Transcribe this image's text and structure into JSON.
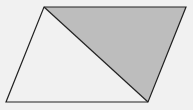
{
  "diagram": {
    "type": "parallelogram-with-diagonal",
    "background": "#f1f1f1",
    "stroke": "#222222",
    "shade_fill": "#bdbdbd",
    "vertices": {
      "top_left": [
        44,
        7
      ],
      "top_right": [
        186,
        7
      ],
      "bottom_right": [
        148,
        102
      ],
      "bottom_left": [
        6,
        102
      ]
    },
    "shaded_region": "triangle top_left-top_right-bottom_right",
    "diagonal": "top_left to bottom_right"
  }
}
